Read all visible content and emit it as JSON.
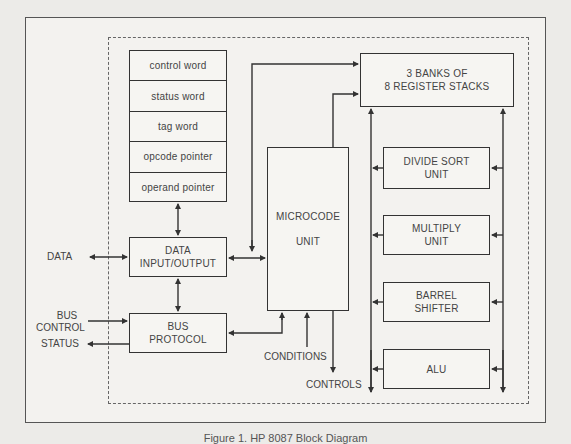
{
  "diagram": {
    "type": "block diagram",
    "register_words": [
      "control word",
      "status word",
      "tag word",
      "opcode pointer",
      "operand pointer"
    ],
    "blocks": {
      "data_io": [
        "DATA",
        "INPUT/OUTPUT"
      ],
      "bus_protocol": [
        "BUS",
        "PROTOCOL"
      ],
      "microcode": [
        "MICROCODE",
        "UNIT"
      ],
      "register_stacks": [
        "3 BANKS OF",
        "8 REGISTER STACKS"
      ],
      "divide_sort": [
        "DIVIDE SORT",
        "UNIT"
      ],
      "multiply": [
        "MULTIPLY",
        "UNIT"
      ],
      "barrel_shifter": [
        "BARREL",
        "SHIFTER"
      ],
      "alu": [
        "ALU"
      ]
    },
    "external_signals": {
      "data": "DATA",
      "bus_control": [
        "BUS",
        "CONTROL"
      ],
      "status": "STATUS",
      "conditions": "CONDITIONS",
      "controls": "CONTROLS"
    },
    "caption": "Figure 1. HP 8087 Block Diagram"
  },
  "colors": {
    "line": "#333333",
    "background": "#ecebe8"
  }
}
